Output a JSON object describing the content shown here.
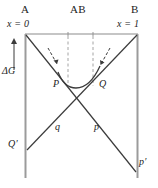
{
  "figure": {
    "colors": {
      "line": "#3b3b3b",
      "axis": "#8c8c8c",
      "dashed": "#9a9a9a",
      "text": "#1c1c1c",
      "background": "#ffffff"
    },
    "labels": {
      "vertex_a": "A",
      "vertex_ab": "AB",
      "vertex_b": "B",
      "x_left": "x = 0",
      "x_right": "x = 1",
      "delta_g": "ΔG",
      "point_p": "P",
      "point_q": "Q",
      "branch_q": "q",
      "branch_p": "p",
      "branch_q_prime": "Q′",
      "branch_p_prime": "p′"
    },
    "axis": {
      "x_min_label": "x = 0",
      "x_max_label": "x = 1",
      "y_label": "ΔG",
      "y_direction": "up"
    },
    "geometry": {
      "frame_left_x": 25,
      "frame_right_x": 138,
      "frame_top_y": 34,
      "frame_bottom_y": 178,
      "crossing_x": 82,
      "crossing_y": 95,
      "dashed_left_x": 68,
      "dashed_right_x": 93,
      "curve_min_y": 88
    }
  }
}
